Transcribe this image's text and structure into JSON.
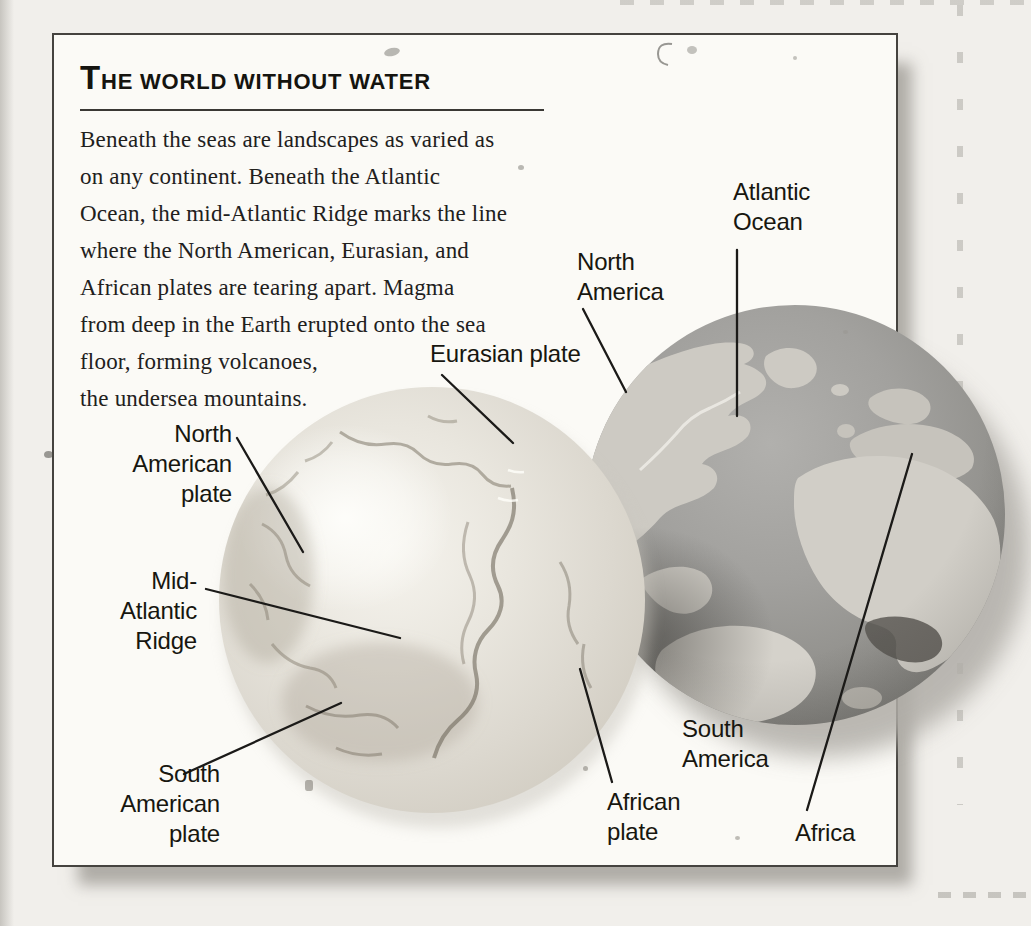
{
  "panel": {
    "title": "THE WORLD WITHOUT WATER",
    "paragraph": "Beneath the seas are landscapes as varied as\non any continent. Beneath the Atlantic\nOcean, the mid-Atlantic Ridge marks the line\nwhere the North American, Eurasian, and\nAfrican plates are tearing apart. Magma\nfrom deep in the Earth erupted onto the sea\nfloor, forming volcanoes,\nthe undersea mountains."
  },
  "labels": {
    "eurasian_plate": "Eurasian plate",
    "north_america": "North\nAmerica",
    "atlantic_ocean": "Atlantic\nOcean",
    "north_american_plate": "North\nAmerican\nplate",
    "mid_atlantic_ridge": "Mid-\nAtlantic\nRidge",
    "south_american_plate": "South\nAmerican\nplate",
    "south_america": "South\nAmerica",
    "african_plate": "African\nplate",
    "africa": "Africa"
  },
  "colors": {
    "paper": "#f1efeb",
    "panel_background": "#fbfaf6",
    "panel_border": "#45433f",
    "text": "#21201c",
    "seafloor_globe_base": "#dcd8cf",
    "ocean_gray": "#92918d",
    "land_gray": "#cdcac3",
    "shadow_gray": "#b0ada7"
  }
}
